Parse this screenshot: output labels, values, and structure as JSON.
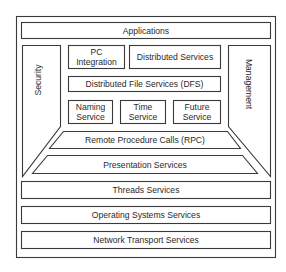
{
  "diagram": {
    "type": "layered-architecture",
    "colors": {
      "stroke": "#3a3a3a",
      "fill": "#ffffff",
      "text": "#2a2a2a"
    },
    "layers": {
      "applications": "Applications",
      "pc_integration": [
        "PC",
        "Integration"
      ],
      "distributed_services": "Distributed Services",
      "dfs": "Distributed File Services (DFS)",
      "naming_service": [
        "Naming",
        "Service"
      ],
      "time_service": [
        "Time",
        "Service"
      ],
      "future_service": [
        "Future",
        "Service"
      ],
      "rpc": "Remote Procedure Calls (RPC)",
      "presentation": "Presentation Services",
      "threads": "Threads Services",
      "os": "Operating Systems Services",
      "network": "Network Transport Services"
    },
    "side_columns": {
      "security": "Security",
      "management": "Management"
    }
  }
}
